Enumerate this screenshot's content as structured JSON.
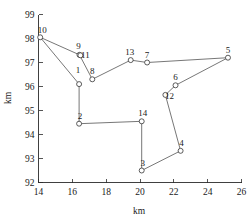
{
  "chart_data": {
    "type": "scatter",
    "title": "",
    "xlabel": "km",
    "ylabel": "km",
    "xlim": [
      14,
      26
    ],
    "ylim": [
      92,
      99
    ],
    "xticks": [
      14,
      16,
      18,
      20,
      22,
      24,
      26
    ],
    "yticks": [
      92,
      93,
      94,
      95,
      96,
      97,
      98,
      99
    ],
    "grid": false,
    "legend": "none",
    "marker": "open-circle",
    "points": [
      {
        "label": "1",
        "x": 16.4,
        "y": 96.1,
        "label_dx": -1,
        "label_dy": -11
      },
      {
        "label": "2",
        "x": 16.4,
        "y": 94.45,
        "label_dx": 1,
        "label_dy": -5
      },
      {
        "label": "3",
        "x": 20.1,
        "y": 92.5,
        "label_dx": 1,
        "label_dy": -5
      },
      {
        "label": "4",
        "x": 22.4,
        "y": 93.32,
        "label_dx": 1,
        "label_dy": -5
      },
      {
        "label": "5",
        "x": 25.2,
        "y": 97.2,
        "label_dx": 0,
        "label_dy": -5
      },
      {
        "label": "6",
        "x": 22.1,
        "y": 96.05,
        "label_dx": 0,
        "label_dy": -5
      },
      {
        "label": "7",
        "x": 20.42,
        "y": 97.0,
        "label_dx": 0,
        "label_dy": -5
      },
      {
        "label": "8",
        "x": 17.18,
        "y": 96.3,
        "label_dx": 0,
        "label_dy": -5
      },
      {
        "label": "9",
        "x": 16.42,
        "y": 97.32,
        "label_dx": -1,
        "label_dy": -6
      },
      {
        "label": "10",
        "x": 14.1,
        "y": 98.05,
        "label_dx": 2,
        "label_dy": -4
      },
      {
        "label": "11",
        "x": 16.48,
        "y": 97.3,
        "label_dx": 5,
        "label_dy": 3
      },
      {
        "label": "12",
        "x": 21.5,
        "y": 95.65,
        "label_dx": 4,
        "label_dy": 4
      },
      {
        "label": "13",
        "x": 19.45,
        "y": 97.1,
        "label_dx": -1,
        "label_dy": -5
      },
      {
        "label": "14",
        "x": 20.1,
        "y": 94.55,
        "label_dx": 1,
        "label_dy": -5
      }
    ],
    "route_order": [
      "10",
      "9",
      "8",
      "13",
      "7",
      "5",
      "6",
      "12",
      "4",
      "3",
      "14",
      "2",
      "1",
      "10"
    ]
  }
}
